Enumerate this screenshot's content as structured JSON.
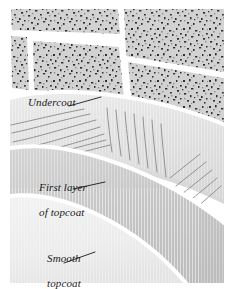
{
  "figure": {
    "name": "paint-layers-cutaway-illustration",
    "background_color": "#ffffff",
    "width": 233,
    "height": 289
  },
  "labels": {
    "undercoat": "Undercoat",
    "first_layer_line1": "First layer",
    "first_layer_line2": "of topcoat",
    "smooth_line1": "Smooth",
    "smooth_line2": "topcoat"
  },
  "layers": [
    {
      "id": "masonry",
      "label": "Masonry blocks",
      "fill": "#cfcfcf",
      "speckle_color": "#2b2b2b",
      "mortar_color": "#ffffff"
    },
    {
      "id": "undercoat",
      "label": "Undercoat",
      "fill": "#e2e2e2",
      "edge": "#ffffff",
      "stroke_color": "#8f8f93"
    },
    {
      "id": "first-topcoat",
      "label": "First layer of topcoat",
      "fill": "#c8c8c8",
      "edge": "#ffffff",
      "stroke_color": "#8f8f93"
    },
    {
      "id": "smooth-topcoat",
      "label": "Smooth topcoat",
      "fill": "#ededed",
      "edge": "#ffffff"
    }
  ],
  "colors": {
    "ink": "#1a1a1a",
    "leader_line": "#1a1a1a",
    "paper": "#ffffff",
    "masonry_base": "#cfcfcf",
    "undercoat_gray": "#e2e2e2",
    "topcoat_mid_gray": "#c8c8c8",
    "topcoat_light_gray": "#ededed",
    "brush_stroke": "#8f8f93"
  }
}
